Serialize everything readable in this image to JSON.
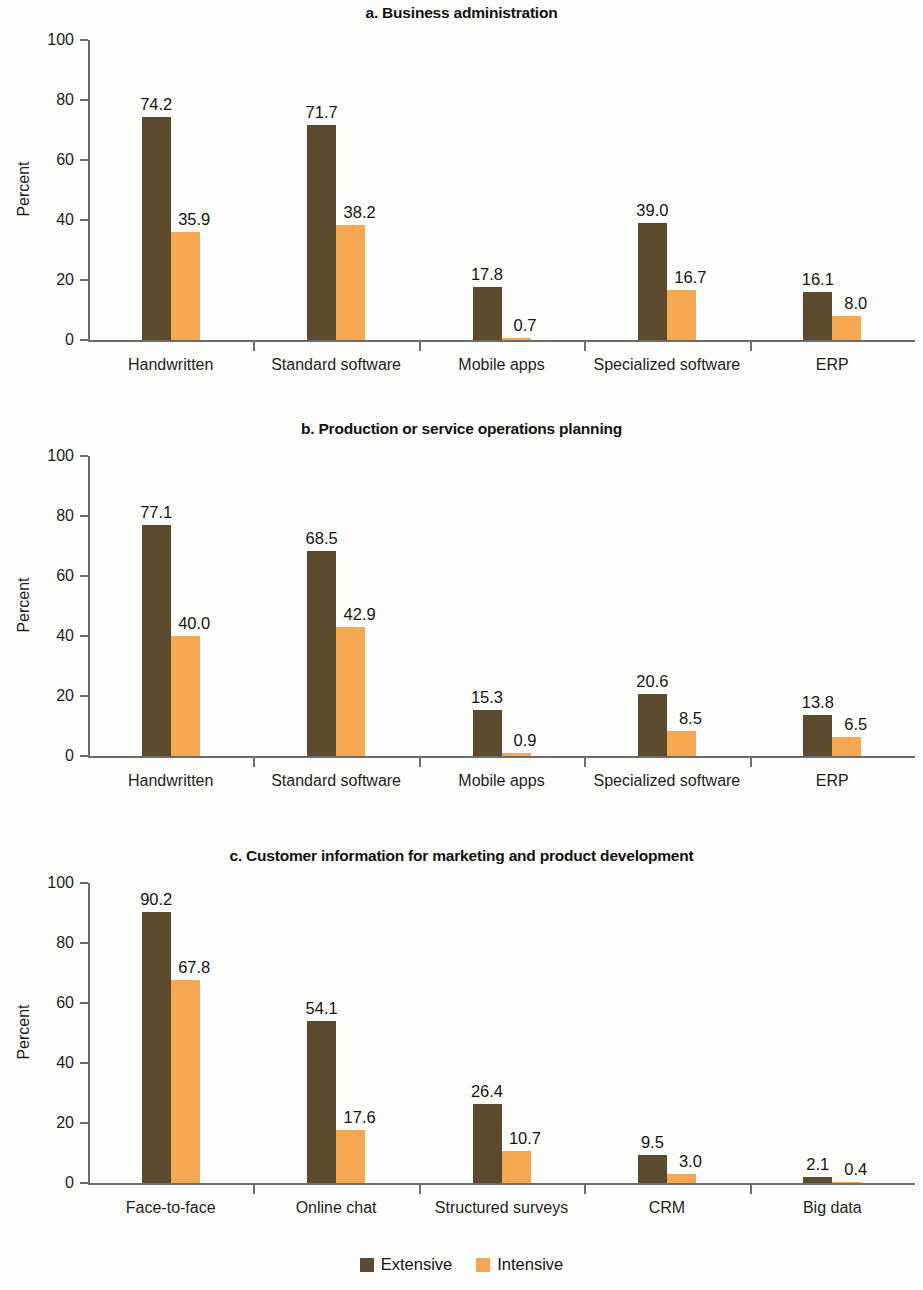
{
  "colors": {
    "extensive": "#5c4a2e",
    "intensive": "#f5a84f",
    "axis": "#6d6d6d",
    "text": "#141414",
    "background": "#fdfdfb"
  },
  "legend": {
    "items": [
      {
        "label": "Extensive",
        "color": "#5c4a2e"
      },
      {
        "label": "Intensive",
        "color": "#f5a84f"
      }
    ]
  },
  "axis": {
    "ylabel": "Percent",
    "yticks": [
      "100",
      "80",
      "60",
      "40",
      "20",
      "0"
    ],
    "ymin": 0,
    "ymax": 100
  },
  "panels": [
    {
      "title": "a. Business administration",
      "categories": [
        "Handwritten",
        "Standard software",
        "Mobile apps",
        "Specialized software",
        "ERP"
      ],
      "extensive": [
        74.2,
        71.7,
        17.8,
        39.0,
        16.1
      ],
      "intensive": [
        35.9,
        38.2,
        0.7,
        16.7,
        8.0
      ],
      "extensive_labels": [
        "74.2",
        "71.7",
        "17.8",
        "39.0",
        "16.1"
      ],
      "intensive_labels": [
        "35.9",
        "38.2",
        "0.7",
        "16.7",
        "8.0"
      ]
    },
    {
      "title": "b. Production or service operations planning",
      "categories": [
        "Handwritten",
        "Standard software",
        "Mobile apps",
        "Specialized software",
        "ERP"
      ],
      "extensive": [
        77.1,
        68.5,
        15.3,
        20.6,
        13.8
      ],
      "intensive": [
        40.0,
        42.9,
        0.9,
        8.5,
        6.5
      ],
      "extensive_labels": [
        "77.1",
        "68.5",
        "15.3",
        "20.6",
        "13.8"
      ],
      "intensive_labels": [
        "40.0",
        "42.9",
        "0.9",
        "8.5",
        "6.5"
      ]
    },
    {
      "title": "c. Customer information for marketing and product development",
      "categories": [
        "Face-to-face",
        "Online chat",
        "Structured surveys",
        "CRM",
        "Big data"
      ],
      "extensive": [
        90.2,
        54.1,
        26.4,
        9.5,
        2.1
      ],
      "intensive": [
        67.8,
        17.6,
        10.7,
        3.0,
        0.4
      ],
      "extensive_labels": [
        "90.2",
        "54.1",
        "26.4",
        "9.5",
        "2.1"
      ],
      "intensive_labels": [
        "67.8",
        "17.6",
        "10.7",
        "3.0",
        "0.4"
      ]
    }
  ],
  "chart_data": {
    "type": "bar",
    "ylabel": "Percent",
    "xlabel": "",
    "ylim": [
      0,
      100
    ],
    "grid": false,
    "legend_position": "bottom-center",
    "series_names": [
      "Extensive",
      "Intensive"
    ],
    "panels": [
      {
        "panel": "a",
        "title": "a. Business administration",
        "categories": [
          "Handwritten",
          "Standard software",
          "Mobile apps",
          "Specialized software",
          "ERP"
        ],
        "series": [
          {
            "name": "Extensive",
            "values": [
              74.2,
              71.7,
              17.8,
              39.0,
              16.1
            ]
          },
          {
            "name": "Intensive",
            "values": [
              35.9,
              38.2,
              0.7,
              16.7,
              8.0
            ]
          }
        ]
      },
      {
        "panel": "b",
        "title": "b. Production or service operations planning",
        "categories": [
          "Handwritten",
          "Standard software",
          "Mobile apps",
          "Specialized software",
          "ERP"
        ],
        "series": [
          {
            "name": "Extensive",
            "values": [
              77.1,
              68.5,
              15.3,
              20.6,
              13.8
            ]
          },
          {
            "name": "Intensive",
            "values": [
              40.0,
              42.9,
              0.9,
              8.5,
              6.5
            ]
          }
        ]
      },
      {
        "panel": "c",
        "title": "c. Customer information for marketing and product development",
        "categories": [
          "Face-to-face",
          "Online chat",
          "Structured surveys",
          "CRM",
          "Big data"
        ],
        "series": [
          {
            "name": "Extensive",
            "values": [
              90.2,
              54.1,
              26.4,
              9.5,
              2.1
            ]
          },
          {
            "name": "Intensive",
            "values": [
              67.8,
              17.6,
              10.7,
              3.0,
              0.4
            ]
          }
        ]
      }
    ],
    "yticks": [
      0,
      20,
      40,
      60,
      80,
      100
    ]
  }
}
